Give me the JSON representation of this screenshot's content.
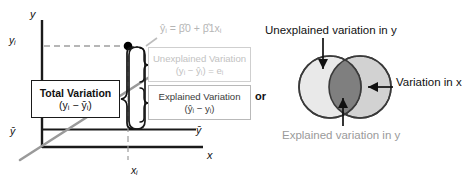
{
  "diagram": {
    "connector_word": "or"
  },
  "scatter_panel": {
    "axes": {
      "y_axis_label": "y",
      "x_axis_label": "x",
      "tick_y_observed": "yᵢ",
      "tick_y_mean_left": "ȳ",
      "tick_y_mean_right": "ȳ",
      "tick_x_observed": "xᵢ"
    },
    "regression_equation": "ŷᵢ = β̂0 + β̂1xᵢ",
    "boxes": {
      "total": {
        "line1": "Total Variation",
        "line2": "(yᵢ − ȳᵢ)",
        "text_color": "#111111",
        "border_color": "#1a1a1a"
      },
      "unexplained": {
        "line1": "Unexplained Variation",
        "line2": "(yᵢ − ŷᵢ) = eᵢ",
        "text_color": "#c2c2c2",
        "border_color": "#cfcfcf"
      },
      "explained": {
        "line1": "Explained Variation",
        "line2": "(ŷᵢ − yᵢ)",
        "text_color": "#3b3b3b",
        "border_color": "#b9b9b9"
      }
    },
    "regression_line_color": "#9a9a9a",
    "data_point_color": "#000000"
  },
  "venn_panel": {
    "labels": {
      "top": "Unexplained variation in y",
      "right": "Variation in x",
      "bottom": "Explained variation in y"
    },
    "colors": {
      "circle_left_fill": "#e9e9e9",
      "circle_right_fill": "#d2d2d2",
      "overlap_fill": "#7f7f7f",
      "circle_stroke": "#3a3a3a",
      "bottom_label_color": "#9a9a9a"
    }
  }
}
